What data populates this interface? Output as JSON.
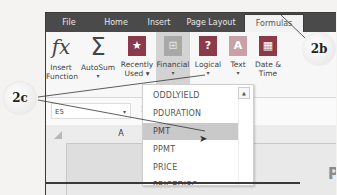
{
  "ribbon_tabs": [
    {
      "label": "File",
      "active": false
    },
    {
      "label": "Home",
      "active": false
    },
    {
      "label": "Insert",
      "active": false
    },
    {
      "label": "Page Layout",
      "active": false
    },
    {
      "label": "Formulas",
      "active": true
    }
  ],
  "ribbon_buttons": {
    "insert_function": {
      "line1": "Insert",
      "line2": "Function",
      "icon": "fx"
    },
    "autosum": {
      "line1": "AutoSum",
      "caret": "▾",
      "icon": "Σ"
    },
    "recently_used": {
      "line1": "Recently",
      "line2": "Used ▾",
      "icon": "★"
    },
    "financial": {
      "line1": "Financial",
      "caret": "▾",
      "icon": "⊞"
    },
    "logical": {
      "line1": "Logical",
      "caret": "▾",
      "icon": "?"
    },
    "text": {
      "line1": "Text",
      "caret": "▾",
      "icon": "A"
    },
    "date_time": {
      "line1": "Date &",
      "line2": "Time",
      "icon": "▦"
    }
  },
  "formula_bar": {
    "name_box": "E5",
    "name_box_caret": "▾",
    "separator": "⋮",
    "cancel": "✕"
  },
  "grid": {
    "column_header": "A",
    "row_number": "1",
    "cell_text_fragment": "RE",
    "right_text_fragment": "P"
  },
  "financial_dropdown": {
    "items": [
      "ODDLYIELD",
      "PDURATION",
      "PMT",
      "PPMT",
      "PRICE",
      "PRICEDISC"
    ],
    "highlighted": "PMT",
    "scroll_up": "▲"
  },
  "callouts": {
    "formulas_tab": "2b",
    "financial_pmt": "2c"
  },
  "colors": {
    "tab_bar": "#4a4a4a",
    "ribbon_bg": "#f7f7f7",
    "selected_button": "#d3d3d3",
    "highlight_row": "#c9c9c9",
    "recently_used_icon": "#8b3a4a",
    "financial_icon": "#a8a8a8",
    "logical_icon": "#8b3a4a",
    "text_icon": "#c8a0a8",
    "date_icon": "#8b3a4a"
  }
}
